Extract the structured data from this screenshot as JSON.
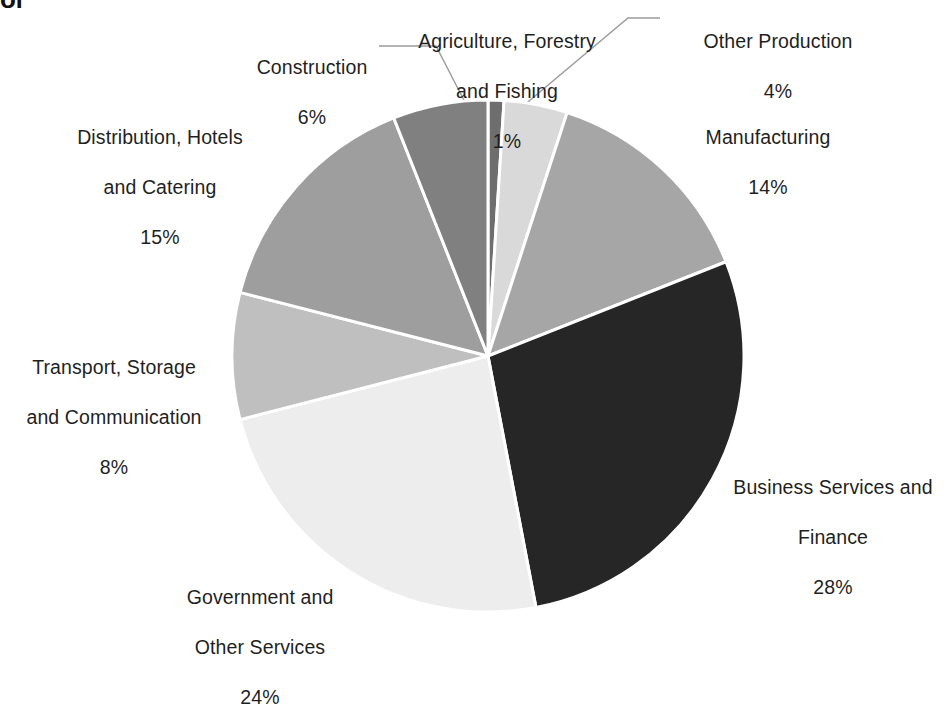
{
  "title_fragment": "of",
  "chart_data": {
    "type": "pie",
    "title": "",
    "legend_position": "labels-outside",
    "start_angle_deg": 0,
    "direction": "clockwise",
    "categories": [
      "Agriculture, Forestry and Fishing",
      "Other Production",
      "Manufacturing",
      "Business Services and Finance",
      "Government and Other Services",
      "Transport, Storage and Communication",
      "Distribution, Hotels and Catering",
      "Construction"
    ],
    "values": [
      1,
      4,
      14,
      28,
      24,
      8,
      15,
      6
    ],
    "value_suffix": "%",
    "colors": [
      "#6e6e6e",
      "#d9d9d9",
      "#a6a6a6",
      "#262626",
      "#ededed",
      "#bfbfbf",
      "#9e9e9e",
      "#808080"
    ],
    "slice_border_color": "#ffffff",
    "slices": [
      {
        "name": "Agriculture, Forestry and Fishing",
        "value": 1,
        "pct_label": "1%",
        "color": "#6e6e6e"
      },
      {
        "name": "Other Production",
        "value": 4,
        "pct_label": "4%",
        "color": "#d9d9d9"
      },
      {
        "name": "Manufacturing",
        "value": 14,
        "pct_label": "14%",
        "color": "#a6a6a6"
      },
      {
        "name": "Business Services and Finance",
        "value": 28,
        "pct_label": "28%",
        "color": "#262626"
      },
      {
        "name": "Government and Other Services",
        "value": 24,
        "pct_label": "24%",
        "color": "#ededed"
      },
      {
        "name": "Transport, Storage and Communication",
        "value": 8,
        "pct_label": "8%",
        "color": "#bfbfbf"
      },
      {
        "name": "Distribution, Hotels and Catering",
        "value": 15,
        "pct_label": "15%",
        "color": "#9e9e9e"
      },
      {
        "name": "Construction",
        "value": 6,
        "pct_label": "6%",
        "color": "#808080"
      }
    ]
  },
  "labels": {
    "agriculture": {
      "line1": "Agriculture, Forestry",
      "line2": "and Fishing",
      "pct": "1%"
    },
    "other_production": {
      "line1": "Other Production",
      "line2": "",
      "pct": "4%"
    },
    "manufacturing": {
      "line1": "Manufacturing",
      "line2": "",
      "pct": "14%"
    },
    "business": {
      "line1": "Business Services and",
      "line2": "Finance",
      "pct": "28%"
    },
    "government": {
      "line1": "Government and",
      "line2": "Other Services",
      "pct": "24%"
    },
    "transport": {
      "line1": "Transport, Storage",
      "line2": "and Communication",
      "pct": "8%"
    },
    "distribution": {
      "line1": "Distribution, Hotels",
      "line2": "and Catering",
      "pct": "15%"
    },
    "construction": {
      "line1": "Construction",
      "line2": "",
      "pct": "6%"
    }
  }
}
